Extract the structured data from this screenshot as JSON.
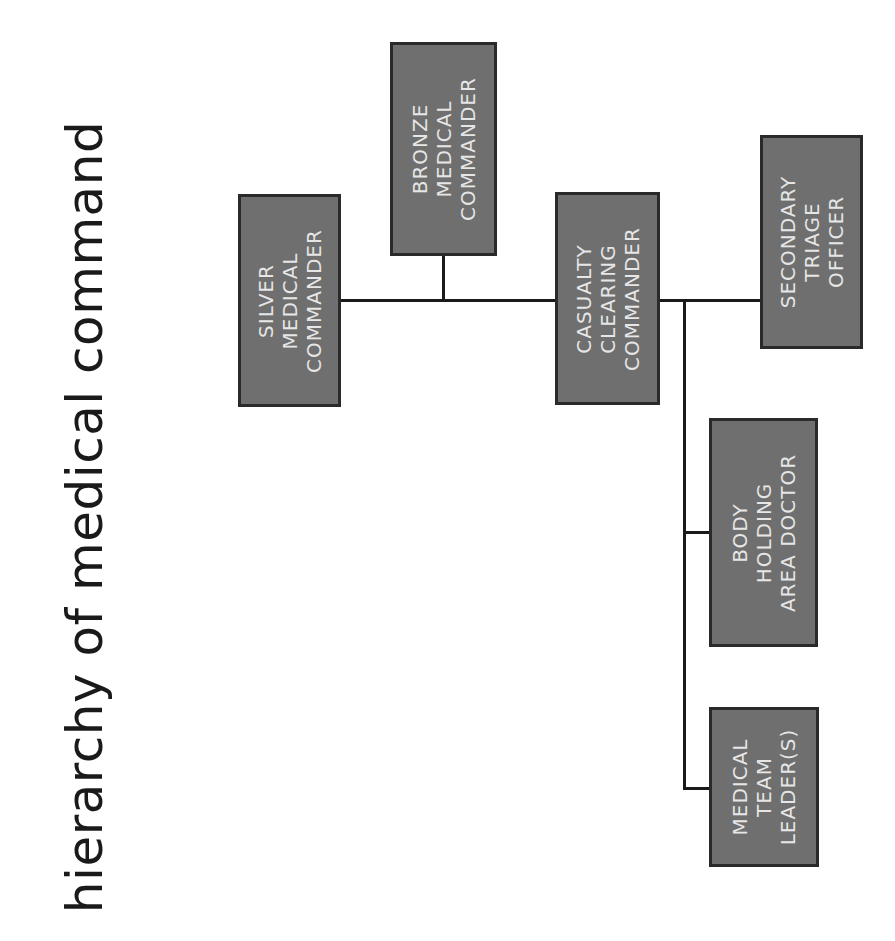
{
  "title": "hierarchy of medical command",
  "colors": {
    "box_fill": "#6f6f6f",
    "box_border": "#2a2a2a",
    "box_text": "#e6e6e6",
    "line": "#1a1a1a",
    "title": "#1a1a1a",
    "background": "#ffffff"
  },
  "nodes": {
    "silver": {
      "label": "SILVER\nMEDICAL\nCOMMANDER"
    },
    "bronze": {
      "label": "BRONZE\nMEDICAL\nCOMMANDER"
    },
    "casualty": {
      "label": "CASUALTY\nCLEARING\nCOMMANDER"
    },
    "secondary": {
      "label": "SECONDARY\nTRIAGE\nOFFICER"
    },
    "body": {
      "label": "BODY\nHOLDING\nAREA DOCTOR"
    },
    "team": {
      "label": "MEDICAL\nTEAM\nLEADER(S)"
    }
  },
  "edges": [
    {
      "from": "silver",
      "to": "casualty"
    },
    {
      "from": "bronze",
      "to": "silver-casualty-link"
    },
    {
      "from": "casualty",
      "to": "secondary"
    },
    {
      "from": "casualty",
      "to": "body"
    },
    {
      "from": "casualty",
      "to": "team"
    }
  ]
}
